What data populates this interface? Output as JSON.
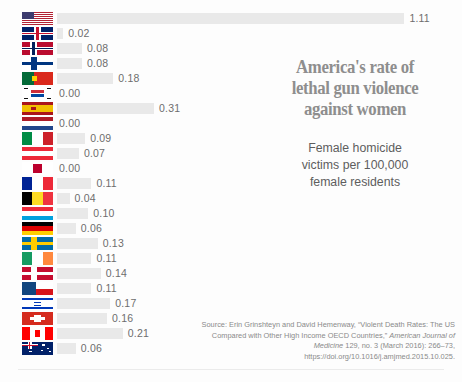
{
  "title_lines": [
    "America's rate of",
    "lethal gun violence",
    "against women"
  ],
  "subtitle_lines": [
    "Female homicide",
    "victims per 100,000",
    "female residents"
  ],
  "source": {
    "prefix": "Source: Erin Grinshteyn and David Hemenway, “Violent Death Rates: The US Compared with Other High Income OECD Countries,” ",
    "italic": "American Journal of Medicine",
    "suffix": " 129, no. 3 (March 2016): 266–73, https://doi.org/10.1016/j.amjmed.2015.10.025."
  },
  "colors": {
    "bar": "#e9e9e9",
    "value_text": "#6d6d6d",
    "title": "#8e8e8e",
    "subtitle": "#5e5e5e",
    "source": "#8a8a8a",
    "background": "#fdfdfd",
    "rule": "#ebebeb"
  },
  "chart_data": {
    "type": "bar",
    "orientation": "horizontal",
    "xlabel": "Female homicide victims per 100,000 female residents",
    "ylabel": "",
    "xlim": [
      0,
      1.11
    ],
    "grid": false,
    "legend": "none",
    "categories": [
      "United States",
      "United Kingdom",
      "Norway",
      "Finland",
      "Portugal",
      "South Korea",
      "Spain",
      "Netherlands",
      "Italy",
      "Austria",
      "Japan",
      "France",
      "Belgium",
      "Luxembourg",
      "Germany",
      "Sweden",
      "Ireland",
      "Denmark",
      "Czech Republic",
      "Israel",
      "Switzerland",
      "Canada",
      "Australia"
    ],
    "values": [
      1.11,
      0.02,
      0.08,
      0.08,
      0.18,
      0.0,
      0.31,
      0.0,
      0.09,
      0.07,
      0.0,
      0.11,
      0.04,
      0.1,
      0.06,
      0.13,
      0.11,
      0.14,
      0.11,
      0.17,
      0.16,
      0.21,
      0.06
    ],
    "value_labels": [
      "1.11",
      "0.02",
      "0.08",
      "0.08",
      "0.18",
      "0.00",
      "0.31",
      "0.00",
      "0.09",
      "0.07",
      "0.00",
      "0.11",
      "0.04",
      "0.10",
      "0.06",
      "0.13",
      "0.11",
      "0.14",
      "0.11",
      "0.17",
      "0.16",
      "0.21",
      "0.06"
    ],
    "icons": [
      "flag-icon-united-states",
      "flag-icon-united-kingdom",
      "flag-icon-norway",
      "flag-icon-finland",
      "flag-icon-portugal",
      "flag-icon-south-korea",
      "flag-icon-spain",
      "flag-icon-netherlands",
      "flag-icon-italy",
      "flag-icon-austria",
      "flag-icon-japan",
      "flag-icon-france",
      "flag-icon-belgium",
      "flag-icon-luxembourg",
      "flag-icon-germany",
      "flag-icon-sweden",
      "flag-icon-ireland",
      "flag-icon-denmark",
      "flag-icon-czech-republic",
      "flag-icon-israel",
      "flag-icon-switzerland",
      "flag-icon-canada",
      "flag-icon-australia"
    ]
  }
}
